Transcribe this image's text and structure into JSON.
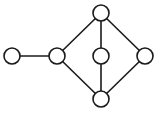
{
  "diagram": {
    "type": "undirected-graph",
    "node_radius": 8,
    "colors": {
      "stroke": "#1a1a1a",
      "node_fill": "#ffffff",
      "background": "#ffffff"
    },
    "nodes": [
      {
        "id": "A",
        "x": 12,
        "y": 56
      },
      {
        "id": "B",
        "x": 57,
        "y": 56
      },
      {
        "id": "C",
        "x": 101,
        "y": 13
      },
      {
        "id": "D",
        "x": 101,
        "y": 56
      },
      {
        "id": "E",
        "x": 145,
        "y": 56
      },
      {
        "id": "F",
        "x": 101,
        "y": 99
      }
    ],
    "edges": [
      {
        "from": "A",
        "to": "B"
      },
      {
        "from": "B",
        "to": "C"
      },
      {
        "from": "B",
        "to": "F"
      },
      {
        "from": "C",
        "to": "D"
      },
      {
        "from": "D",
        "to": "F"
      },
      {
        "from": "C",
        "to": "E"
      },
      {
        "from": "E",
        "to": "F"
      }
    ]
  }
}
